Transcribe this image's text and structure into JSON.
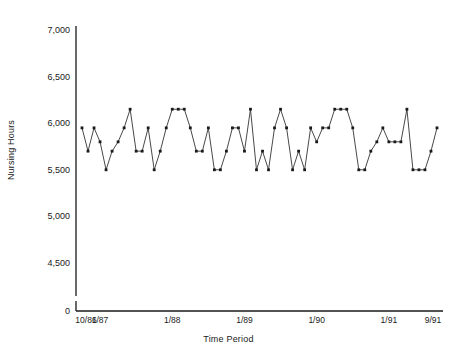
{
  "chart_data": {
    "type": "line",
    "title": "",
    "subtitle": "",
    "xlabel": "Time Period",
    "ylabel": "Nursing Hours",
    "grid": false,
    "legend": "none",
    "ylim": [
      0,
      7000
    ],
    "y_ticks": [
      0,
      4500,
      5000,
      5500,
      6000,
      6500,
      7000
    ],
    "y_tick_labels": [
      "0",
      "4,500",
      "5,000",
      "5,500",
      "6,000",
      "6,500",
      "7,000"
    ],
    "y_axis_break_below": 4500,
    "x_tick_labels": [
      "10/86",
      "1/87",
      "1/88",
      "1/89",
      "1/90",
      "1/91",
      "9/91"
    ],
    "x_tick_indices": [
      0,
      3,
      15,
      27,
      39,
      51,
      59
    ],
    "x": [
      "10/86",
      "11/86",
      "12/86",
      "1/87",
      "2/87",
      "3/87",
      "4/87",
      "5/87",
      "6/87",
      "7/87",
      "8/87",
      "9/87",
      "10/87",
      "11/87",
      "12/87",
      "1/88",
      "2/88",
      "3/88",
      "4/88",
      "5/88",
      "6/88",
      "7/88",
      "8/88",
      "9/88",
      "10/88",
      "11/88",
      "12/88",
      "1/89",
      "2/89",
      "3/89",
      "4/89",
      "5/89",
      "6/89",
      "7/89",
      "8/89",
      "9/89",
      "10/89",
      "11/89",
      "12/89",
      "1/90",
      "2/90",
      "3/90",
      "4/90",
      "5/90",
      "6/90",
      "7/90",
      "8/90",
      "9/90",
      "10/90",
      "11/90",
      "12/90",
      "1/91",
      "2/91",
      "3/91",
      "4/91",
      "5/91",
      "6/91",
      "7/91",
      "8/91",
      "9/91"
    ],
    "values": [
      5950,
      5700,
      5950,
      5800,
      5500,
      5700,
      5800,
      5950,
      6150,
      5700,
      5700,
      5950,
      5500,
      5700,
      5950,
      6150,
      6150,
      6150,
      5950,
      5700,
      5700,
      5950,
      5500,
      5500,
      5700,
      5950,
      5950,
      5700,
      6150,
      5500,
      5700,
      5500,
      5950,
      6150,
      5950,
      5500,
      5700,
      5500,
      5950,
      5800,
      5950,
      5950,
      6150,
      6150,
      6150,
      5950,
      5500,
      5500,
      5700,
      5800,
      5950,
      5800,
      5800,
      5800,
      6150,
      5500,
      5500,
      5500,
      5700,
      5950
    ],
    "marker": "square",
    "marker_color": "#1a1a1a",
    "line_color": "#333333",
    "line_style": "solid",
    "line_width": 0.9,
    "units": "hours"
  },
  "axes": {
    "y_title": "Nursing Hours",
    "x_title": "Time Period"
  },
  "colors": {
    "background": "#ffffff",
    "axis": "#1a1a1a",
    "marker": "#1a1a1a",
    "line": "#333333",
    "text": "#1a1a1a"
  }
}
